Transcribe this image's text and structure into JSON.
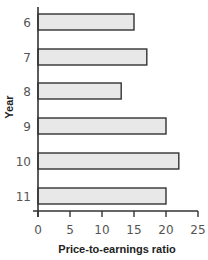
{
  "chart_data": {
    "type": "bar",
    "orientation": "horizontal",
    "title": "",
    "categories": [
      "6",
      "7",
      "8",
      "9",
      "10",
      "11"
    ],
    "values": [
      15,
      17,
      13,
      20,
      22,
      20
    ],
    "series": [
      {
        "name": "Price-to-earnings ratio",
        "values": [
          15,
          17,
          13,
          20,
          22,
          20
        ]
      }
    ],
    "xlabel": "Price-to-earnings ratio",
    "ylabel": "Year",
    "xlim": [
      0,
      25
    ],
    "xticks": [
      0,
      5,
      10,
      15,
      20,
      25
    ],
    "grid": false,
    "legend": null,
    "bar_fill": "#e8e8e8",
    "bar_stroke": "#333333"
  }
}
